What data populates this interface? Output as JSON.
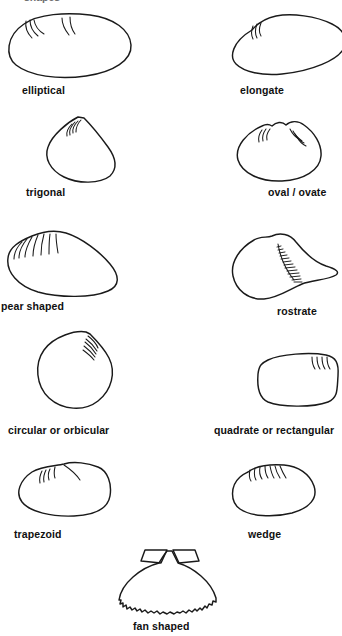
{
  "figure": {
    "background_color": "#ffffff",
    "stroke_color": "#1a1a1a",
    "label_color": "#101010",
    "clipped_header_text": "shapes",
    "width": 338,
    "height": 636
  },
  "shapes": [
    {
      "id": "elliptical",
      "label": "elliptical",
      "column": "left",
      "row": 1,
      "label_x": 22,
      "label_y": 84,
      "shape_x": 4,
      "shape_y": 12,
      "shape_w": 130,
      "shape_h": 66,
      "ridge_count": 6,
      "description": "broad rounded ellipse, longer than tall, umbo near upper left of center"
    },
    {
      "id": "elongate",
      "label": "elongate",
      "column": "right",
      "row": 1,
      "label_x": 240,
      "label_y": 84,
      "shape_x": 228,
      "shape_y": 12,
      "shape_w": 120,
      "shape_h": 66,
      "ridge_count": 4,
      "description": "long low shell with angular upper-left beak tapering to a narrow posterior point at right"
    },
    {
      "id": "trigonal",
      "label": "trigonal",
      "column": "left",
      "row": 2,
      "label_x": 26,
      "label_y": 186,
      "shape_x": 40,
      "shape_y": 115,
      "shape_w": 84,
      "shape_h": 68,
      "ridge_count": 5,
      "description": "triangular, pointed apex at top, broad rounded base"
    },
    {
      "id": "oval-ovate",
      "label": "oval / ovate",
      "column": "right",
      "row": 2,
      "label_x": 268,
      "label_y": 186,
      "shape_x": 234,
      "shape_y": 120,
      "shape_w": 90,
      "shape_h": 62,
      "ridge_count": 8,
      "description": "rounded egg shape with two small umbos and a notch at the top"
    },
    {
      "id": "pear-shaped",
      "label": "pear shaped",
      "column": "left",
      "row": 3,
      "label_x": 1,
      "label_y": 300,
      "shape_x": 4,
      "shape_y": 228,
      "shape_w": 118,
      "shape_h": 68,
      "ridge_count": 7,
      "description": "wide at the left anterior end with radiating ribs, tapering to a rounded narrow right end"
    },
    {
      "id": "rostrate",
      "label": "rostrate",
      "column": "right",
      "row": 3,
      "label_x": 277,
      "label_y": 305,
      "shape_x": 230,
      "shape_y": 232,
      "shape_w": 112,
      "shape_h": 72,
      "ridge_count": 14,
      "description": "rounded body drawn out into a beak-like rostrum at the right, with fine hatching along the fold"
    },
    {
      "id": "circular-orbicular",
      "label": "circular or orbicular",
      "column": "left",
      "row": 4,
      "label_x": 8,
      "label_y": 424,
      "shape_x": 34,
      "shape_y": 328,
      "shape_w": 80,
      "shape_h": 82,
      "ridge_count": 6,
      "description": "nearly circular outline with small pointed umbo at top right"
    },
    {
      "id": "quadrate-rectangular",
      "label": "quadrate or rectangular",
      "column": "right",
      "row": 4,
      "label_x": 214,
      "label_y": 424,
      "shape_x": 255,
      "shape_y": 350,
      "shape_w": 84,
      "shape_h": 56,
      "ridge_count": 4,
      "description": "boxy rounded rectangle with ridges at the upper right corner"
    },
    {
      "id": "trapezoid",
      "label": "trapezoid",
      "column": "left",
      "row": 5,
      "label_x": 14,
      "label_y": 528,
      "shape_x": 16,
      "shape_y": 460,
      "shape_w": 100,
      "shape_h": 58,
      "ridge_count": 4,
      "description": "four sided with sloping shoulders, narrow top and wider rounded base"
    },
    {
      "id": "wedge",
      "label": "wedge",
      "column": "right",
      "row": 5,
      "label_x": 248,
      "label_y": 528,
      "shape_x": 228,
      "shape_y": 462,
      "shape_w": 90,
      "shape_h": 56,
      "ridge_count": 7,
      "description": "blunt angular top-left shoulder with combed ribs, tapering wedge to the right"
    },
    {
      "id": "fan-shaped",
      "label": "fan shaped",
      "column": "center",
      "row": 6,
      "label_x": 133,
      "label_y": 620,
      "shape_x": 113,
      "shape_y": 548,
      "shape_w": 112,
      "shape_h": 66,
      "ridge_count": 22,
      "description": "scallop outline with triangular ears at the hinge and a crenulated scalloped ventral margin"
    }
  ]
}
